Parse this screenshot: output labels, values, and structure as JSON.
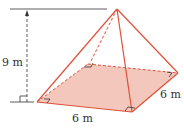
{
  "figure": {
    "type": "square pyramid",
    "labels": {
      "height": "9 m",
      "base_front": "6 m",
      "base_side": "6 m"
    },
    "colors": {
      "edge": "#e0503a",
      "base_fill": "#f3c7bb",
      "dimension_line": "#333333"
    }
  }
}
